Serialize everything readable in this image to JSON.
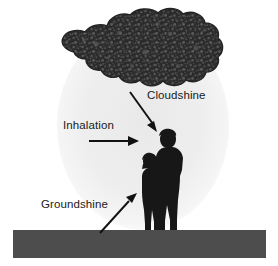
{
  "diagram": {
    "type": "illustration",
    "background_color": "#ffffff",
    "colors": {
      "plume_cloud": "#2b2b2b",
      "plume_cloud_speckle": "#555555",
      "dispersion_halo": "#efefef",
      "ground_bar": "#4d4d4d",
      "silhouette": "#1a1a1a",
      "arrow": "#111111",
      "label_text": "#1a1a1a"
    },
    "labels": [
      {
        "id": "cloudshine",
        "text": "Cloudshine",
        "arrow": "diagonal-down-right",
        "description": "Direct gamma radiation from the airborne plume overhead"
      },
      {
        "id": "inhalation",
        "text": "Inhalation",
        "arrow": "horizontal-right",
        "description": "Breathing in airborne radioactive material"
      },
      {
        "id": "groundshine",
        "text": "Groundshine",
        "arrow": "diagonal-up-right",
        "description": "Gamma radiation from material deposited on the ground"
      }
    ],
    "elements": {
      "plume_cloud": "dark mottled radioactive plume across the top",
      "dispersion_halo": "light grey oval representing the dispersed airborne concentration",
      "figures": "silhouettes of an adult and a child standing together",
      "ground_bar": "dark grey horizontal bar representing contaminated ground"
    }
  }
}
